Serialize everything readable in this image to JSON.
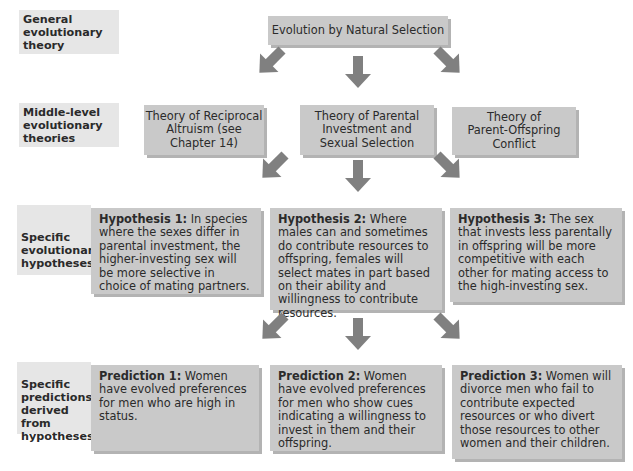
{
  "levels": [
    {
      "label": "General evolutionary theory"
    },
    {
      "label": "Middle-level evolutionary theories"
    },
    {
      "label": "Specific evolutionary hypotheses"
    },
    {
      "label": "Specific predictions derived from hypotheses"
    }
  ],
  "general_theory": {
    "text": "Evolution by Natural Selection"
  },
  "middle_theories": [
    {
      "text": "Theory of Reciprocal Altruism (see Chapter 14)"
    },
    {
      "text": "Theory of Parental Investment and Sexual Selection"
    },
    {
      "text": "Theory of Parent-Offspring Conflict"
    }
  ],
  "hypotheses": [
    {
      "title": "Hypothesis 1:",
      "text": " In species where the sexes differ in parental investment, the higher-investing sex will be more selective in choice of mating partners."
    },
    {
      "title": "Hypothesis 2:",
      "text": " Where males can and sometimes do contribute resources to offspring, females will select mates in part based on their ability and willingness to contribute resources."
    },
    {
      "title": "Hypothesis 3:",
      "text": " The sex that invests less parentally in offspring will be more competitive with each other for mating access to the high-investing sex."
    }
  ],
  "predictions": [
    {
      "title": "Prediction 1:",
      "text": " Women have evolved preferences for men who are high in status."
    },
    {
      "title": "Prediction 2:",
      "text": " Women have evolved preferences for men who show cues indicating a willingness to invest in them and their offspring."
    },
    {
      "title": "Prediction 3:",
      "text": " Women will divorce men who fail to contribute expected resources or who divert those resources to other women and their children."
    }
  ],
  "colors": {
    "box": "#c9c9c9",
    "label_bg": "#e6e6e6",
    "arrow": "#808080"
  }
}
